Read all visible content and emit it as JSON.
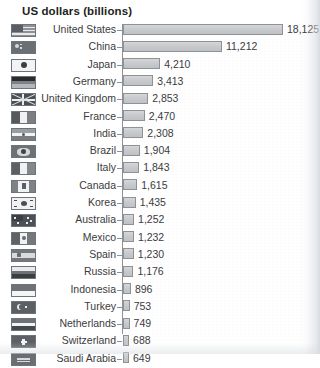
{
  "chart_data": {
    "type": "bar",
    "title": "US dollars (billions)",
    "orientation": "horizontal",
    "xlabel": "",
    "ylabel": "",
    "grid": false,
    "legend": "none",
    "xlim": [
      0,
      18125
    ],
    "value_format": "thousands-separated",
    "categories": [
      "United States",
      "China",
      "Japan",
      "Germany",
      "United Kingdom",
      "France",
      "India",
      "Brazil",
      "Italy",
      "Canada",
      "Korea",
      "Australia",
      "Mexico",
      "Spain",
      "Russia",
      "Indonesia",
      "Turkey",
      "Netherlands",
      "Switzerland",
      "Saudi Arabia"
    ],
    "values": [
      18125,
      11212,
      4210,
      3413,
      2853,
      2470,
      2308,
      1904,
      1843,
      1615,
      1435,
      1252,
      1232,
      1230,
      1176,
      896,
      753,
      749,
      688,
      649
    ],
    "value_labels": [
      "18,125",
      "11,212",
      "4,210",
      "3,413",
      "2,853",
      "2,470",
      "2,308",
      "1,904",
      "1,843",
      "1,615",
      "1,435",
      "1,252",
      "1,232",
      "1,230",
      "1,176",
      "896",
      "753",
      "749",
      "688",
      "649"
    ],
    "flags": [
      "united-states-flag",
      "china-flag",
      "japan-flag",
      "germany-flag",
      "united-kingdom-flag",
      "france-flag",
      "india-flag",
      "brazil-flag",
      "italy-flag",
      "canada-flag",
      "korea-flag",
      "australia-flag",
      "mexico-flag",
      "spain-flag",
      "russia-flag",
      "indonesia-flag",
      "turkey-flag",
      "netherlands-flag",
      "switzerland-flag",
      "saudi-arabia-flag"
    ]
  },
  "colors": {
    "bar_fill": "#c8cacd",
    "bar_border": "#8e9296",
    "axis": "#8d9197",
    "text": "#3b3b3d",
    "title_text": "#231f20",
    "background": "#ffffff"
  }
}
